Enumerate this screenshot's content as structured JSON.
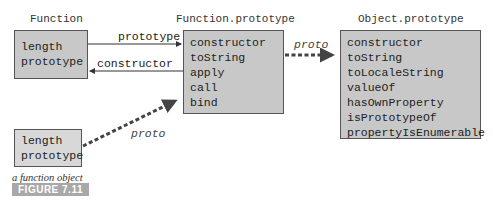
{
  "nodes": {
    "function": {
      "title": "Function",
      "props": [
        "length",
        "prototype"
      ]
    },
    "function_prototype": {
      "title": "Function.prototype",
      "props": [
        "constructor",
        "toString",
        "apply",
        "call",
        "bind"
      ]
    },
    "object_prototype": {
      "title": "Object.prototype",
      "props": [
        "constructor",
        "toString",
        "toLocaleString",
        "valueOf",
        "hasOwnProperty",
        "isPrototypeOf",
        "propertyIsEnumerable"
      ]
    },
    "function_object": {
      "caption": "a function object",
      "props": [
        "length",
        "prototype"
      ]
    }
  },
  "edges": {
    "prototype": "prototype",
    "constructor": "constructor",
    "proto_top": "proto",
    "proto_bottom": "proto"
  },
  "figure": {
    "label": "FIGURE 7.11"
  },
  "colors": {
    "box_fill": "#c8c8c8",
    "box_light_fill": "#d8d8d8",
    "box_border": "#555555",
    "arrow": "#333333",
    "badge": "#a8a8a8"
  }
}
